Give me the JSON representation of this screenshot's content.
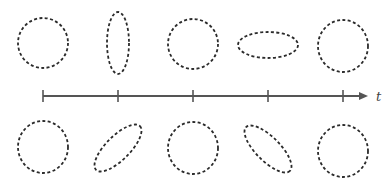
{
  "diagram": {
    "axis": {
      "label": "t",
      "x_start": 43,
      "x_end": 368,
      "y": 96,
      "ticks": [
        43,
        118,
        193,
        268,
        343
      ],
      "color": "#555555"
    },
    "top_row": [
      {
        "type": "circle",
        "cx": 43,
        "cy": 43,
        "rx": 25,
        "ry": 25,
        "rotation": 0
      },
      {
        "type": "ellipse-vertical",
        "cx": 118,
        "cy": 43,
        "rx": 11,
        "ry": 31,
        "rotation": 0
      },
      {
        "type": "circle",
        "cx": 193,
        "cy": 44,
        "rx": 25,
        "ry": 25,
        "rotation": 0
      },
      {
        "type": "ellipse-horizontal",
        "cx": 268,
        "cy": 45,
        "rx": 30,
        "ry": 13,
        "rotation": 0
      },
      {
        "type": "circle",
        "cx": 343,
        "cy": 46,
        "rx": 25,
        "ry": 26,
        "rotation": 0
      }
    ],
    "bottom_row": [
      {
        "type": "circle",
        "cx": 43,
        "cy": 147,
        "rx": 25,
        "ry": 26,
        "rotation": 0
      },
      {
        "type": "ellipse-tilted-right",
        "cx": 118,
        "cy": 148,
        "rx": 31,
        "ry": 12,
        "rotation": -45
      },
      {
        "type": "circle",
        "cx": 193,
        "cy": 148,
        "rx": 25,
        "ry": 26,
        "rotation": 0
      },
      {
        "type": "ellipse-tilted-left",
        "cx": 268,
        "cy": 149,
        "rx": 31,
        "ry": 12,
        "rotation": 45
      },
      {
        "type": "circle",
        "cx": 343,
        "cy": 151,
        "rx": 25,
        "ry": 26,
        "rotation": 0
      }
    ],
    "stroke_color": "#2b2b2b"
  }
}
